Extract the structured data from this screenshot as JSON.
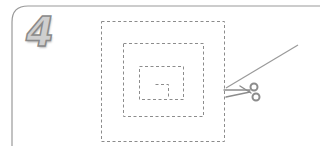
{
  "step": {
    "number": "4"
  },
  "illustration": {
    "subject": "dashed square spiral cutting guide",
    "icons": [
      "scissors-icon"
    ],
    "colors": {
      "frame": "#9a9a9a",
      "dashed_line": "#8c8c8c",
      "cut_line": "#9a9a9a",
      "scissors": "#8c8c8c",
      "digit_fill": "#cfcfcf",
      "digit_stroke": "#8a8a8a"
    }
  }
}
